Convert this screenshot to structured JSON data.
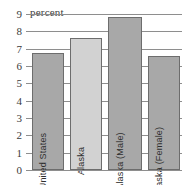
{
  "chart_data": {
    "type": "bar",
    "title": "",
    "unit_label": "percent",
    "xlabel": "",
    "ylabel": "percent",
    "ylim": [
      0,
      9
    ],
    "ytick_step": 1,
    "yticks": [
      9,
      8,
      7,
      6,
      5,
      4,
      3,
      2,
      1,
      0
    ],
    "grid": true,
    "legend": "none",
    "categories": [
      "United States",
      "Alaska",
      "Alaska (Male)",
      "Alaska (Female)"
    ],
    "values": [
      6.75,
      7.6,
      8.8,
      6.6
    ],
    "bar_colors": [
      "#a8a8a8",
      "#d2d2d2",
      "#a8a8a8",
      "#a8a8a8"
    ],
    "bar_border_color": "#6d6d6d",
    "axis_color": "#8e8e8e",
    "text_color": "#3b3b3b",
    "background": "#ffffff"
  }
}
